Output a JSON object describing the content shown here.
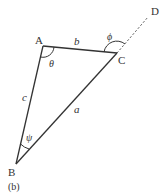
{
  "diagram": {
    "type": "triangle",
    "caption": "(b)",
    "vertices": {
      "A": {
        "label": "A",
        "x": 43,
        "y": 46
      },
      "B": {
        "label": "B",
        "x": 16,
        "y": 164
      },
      "C": {
        "label": "C",
        "x": 117,
        "y": 53
      },
      "D": {
        "label": "D",
        "x": 148,
        "y": 17
      }
    },
    "sides": {
      "a": {
        "label": "a",
        "from": "B",
        "to": "C"
      },
      "b": {
        "label": "b",
        "from": "A",
        "to": "C"
      },
      "c": {
        "label": "c",
        "from": "A",
        "to": "B"
      }
    },
    "extension": {
      "from": "C",
      "to": "D",
      "style": "dashed"
    },
    "angles": {
      "theta": {
        "label": "θ",
        "at": "A"
      },
      "phi": {
        "label": "ϕ",
        "at": "C",
        "note": "exterior angle between CA and CD"
      },
      "psi": {
        "label": "ψ",
        "at": "B"
      }
    },
    "colors": {
      "stroke": "#333333",
      "background": "#ffffff"
    }
  }
}
